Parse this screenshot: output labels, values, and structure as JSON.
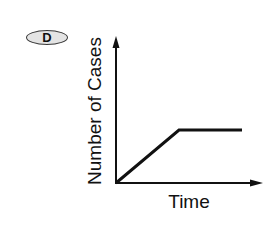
{
  "badge": {
    "label": "D",
    "fill": "#e4e4e4",
    "stroke": "#3a3a3a"
  },
  "chart_data": {
    "type": "line",
    "title": "",
    "xlabel": "Time",
    "ylabel": "Number of Cases",
    "x_ticks": [],
    "y_ticks": [],
    "grid": false,
    "legend": null,
    "series": [
      {
        "name": "Number of Cases",
        "color": "#111111",
        "points": [
          {
            "x": 0,
            "y": 0
          },
          {
            "x": 0.45,
            "y": 0.5
          },
          {
            "x": 0.9,
            "y": 0.5
          }
        ]
      }
    ],
    "xlim": [
      0,
      1
    ],
    "ylim": [
      0,
      1
    ]
  }
}
